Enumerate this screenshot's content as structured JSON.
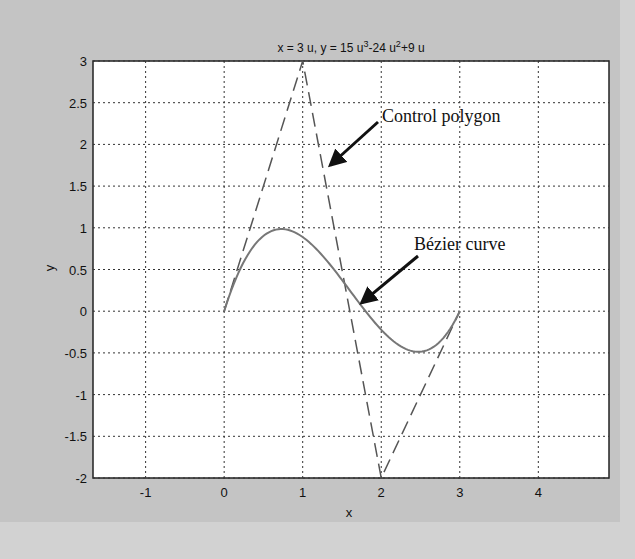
{
  "chart_data": {
    "type": "line",
    "title_parts": {
      "a": "x = 3 u, y = 15 u",
      "sup1": "3",
      "b": "-24 u",
      "sup2": "2",
      "c": "+9 u"
    },
    "xlabel": "x",
    "ylabel": "y",
    "xlim": [
      -1.67,
      4.9
    ],
    "ylim": [
      -2,
      3
    ],
    "x_ticks": [
      -1,
      0,
      1,
      2,
      3,
      4
    ],
    "x_tick_labels": [
      "-1",
      "0",
      "1",
      "2",
      "3",
      "4"
    ],
    "y_ticks": [
      3,
      2.5,
      2,
      1.5,
      1,
      0.5,
      0,
      -0.5,
      -1,
      -1.5,
      -2
    ],
    "y_tick_labels": [
      "3",
      "2.5",
      "2",
      "1.5",
      "1",
      "0.5",
      "0",
      "-0.5",
      "-1",
      "-1.5",
      "-2"
    ],
    "grid": true,
    "series": [
      {
        "name": "Control polygon",
        "style": "dashed",
        "x": [
          0,
          1,
          2,
          3
        ],
        "y": [
          0,
          3,
          -2,
          0
        ]
      },
      {
        "name": "Bézier curve",
        "style": "solid",
        "x": [
          0,
          0.3,
          0.6,
          0.75,
          0.9,
          1.2,
          1.5,
          1.8,
          2.1,
          2.4,
          2.55,
          2.7,
          3.0
        ],
        "y": [
          0,
          0.675,
          0.96,
          0.984,
          0.945,
          0.72,
          0.375,
          0.0,
          -0.315,
          -0.48,
          -0.456,
          -0.315,
          0
        ]
      }
    ],
    "annotations": [
      {
        "text": "Control polygon",
        "arrow_to": [
          1.35,
          1.75
        ]
      },
      {
        "text": "Bézier curve",
        "arrow_to": [
          1.75,
          0.1
        ]
      }
    ]
  },
  "labels": {
    "annot_polygon": "Control polygon",
    "annot_curve": "Bézier curve",
    "xlabel": "x",
    "ylabel": "y"
  }
}
